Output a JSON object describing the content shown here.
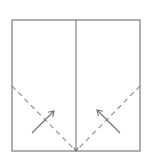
{
  "diagram": {
    "type": "origami-fold-step",
    "colors": {
      "line": "#7a7a7a",
      "dashed": "#8a8a8a",
      "arrow": "#6e6e6e",
      "background": "#ffffff"
    },
    "square": {
      "x": 12,
      "y": 20,
      "width": 128,
      "height": 131
    },
    "center_crease": {
      "x": 76,
      "y1": 20,
      "y2": 151
    },
    "valley_folds": [
      {
        "name": "left-valley-fold",
        "x1": 12,
        "y1": 86,
        "x2": 76,
        "y2": 151
      },
      {
        "name": "right-valley-fold",
        "x1": 140,
        "y1": 86,
        "x2": 76,
        "y2": 151
      }
    ],
    "fold_arrows": [
      {
        "name": "left-fold-arrow",
        "x1": 32,
        "y1": 133,
        "x2": 54,
        "y2": 111,
        "direction": "up-right"
      },
      {
        "name": "right-fold-arrow",
        "x1": 120,
        "y1": 133,
        "x2": 97,
        "y2": 110,
        "direction": "up-left"
      }
    ],
    "center_marker": {
      "x": 76,
      "y": 151,
      "direction": "down"
    }
  }
}
